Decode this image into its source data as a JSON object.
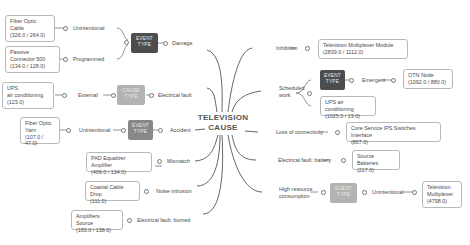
{
  "root": {
    "line1": "TELEVISION",
    "line2": "CAUSE"
  },
  "left": {
    "damage": {
      "label": "Damage",
      "tag": "EVENT TYPE",
      "tag_line1": "EVENT",
      "tag_line2": "TYPE",
      "children": [
        {
          "label": "Unintentional",
          "box": [
            "Fiber Optic",
            "Cable",
            "(326.0 / 264.0)"
          ]
        },
        {
          "label": "Programmed",
          "box": [
            "Passive",
            "Connector 500",
            "(134.0 / 128.0)"
          ]
        }
      ]
    },
    "electrical_fault": {
      "label": "Electrical fault",
      "tag_line1": "CAUSE",
      "tag_line2": "TYPE",
      "child": {
        "label": "External",
        "box": [
          "UPS",
          "air conditioning",
          "(123.0)"
        ]
      }
    },
    "accident": {
      "label": "Accident",
      "tag_line1": "EVENT",
      "tag_line2": "TYPE",
      "child": {
        "label": "Unintentional",
        "box": [
          "Fiber Optic",
          "Yarn",
          "(107.0 / 47.0)"
        ]
      }
    },
    "mismatch": {
      "label": "Mismatch",
      "box": [
        "PAD Equalizer Amplifier",
        "(409.0 / 134.0)"
      ]
    },
    "noise": {
      "label": "Noise intrusion",
      "box": [
        "Coaxial Cable Drop",
        "(111.0)"
      ]
    },
    "burned": {
      "label": "Electrical fault: burned",
      "box": [
        "Amplifiers Source",
        "(183.0 / 138.0)"
      ]
    }
  },
  "right": {
    "inhibition": {
      "label": "Inhibition",
      "box": [
        "Television Multiplexer Module",
        "(2839.0 / 1112.0)"
      ]
    },
    "scheduled": {
      "label_line1": "Scheduled",
      "label_line2": "work",
      "tag_line1": "EVENT",
      "tag_line2": "TYPE",
      "emergent": {
        "label": "Emergent",
        "box": [
          "OTN Node",
          "(1092.0 / 880.0)"
        ]
      },
      "box": [
        "UPS air conditioning",
        "(1025.0 / 13.0)"
      ]
    },
    "loss": {
      "label": "Loss of connectivity",
      "box": [
        "Core Service IPS Switches Interface",
        "(857.0)"
      ]
    },
    "battery": {
      "label": "Electrical fault: battery",
      "box": [
        "Source Batteries",
        "(217.0)"
      ]
    },
    "high": {
      "label_line1": "High resource",
      "label_line2": "consumption",
      "tag_line1": "EVENT",
      "tag_line2": "TYPE",
      "child": {
        "label": "Unintentional",
        "box": [
          "Television",
          "Multiplexer",
          "(4798.0)"
        ]
      }
    }
  },
  "colors": {
    "tag_dark": "#4d4d4d",
    "tag_mid": "#888888",
    "tag_light": "#b3b3b3",
    "line": "#555555",
    "border": "#b8b8b8"
  }
}
